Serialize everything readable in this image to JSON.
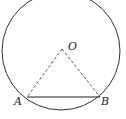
{
  "diagram": {
    "type": "geometry",
    "circle": {
      "cx": 61,
      "cy": 51,
      "r": 59
    },
    "points": {
      "O": {
        "label": "O",
        "x": 62,
        "y": 49
      },
      "A": {
        "label": "A",
        "x": 27,
        "y": 97
      },
      "B": {
        "label": "B",
        "x": 100,
        "y": 97
      }
    },
    "segments": [
      {
        "from": "O",
        "to": "A",
        "style": "dashed"
      },
      {
        "from": "O",
        "to": "B",
        "style": "dashed"
      },
      {
        "from": "A",
        "to": "B",
        "style": "solid"
      }
    ],
    "colors": {
      "stroke": "#333333",
      "background": "#ffffff"
    }
  }
}
